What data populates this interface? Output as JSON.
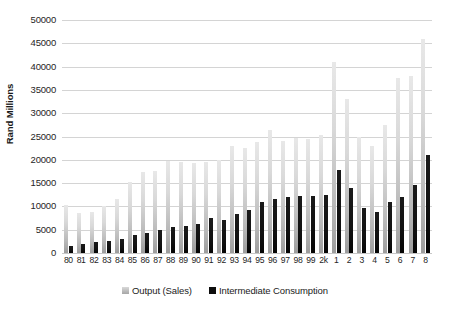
{
  "chart_data": {
    "type": "bar",
    "title": "",
    "xlabel": "",
    "ylabel": "Rand Millions",
    "ylim": [
      0,
      50000
    ],
    "ytick_step": 5000,
    "yticks": [
      "50000",
      "45000",
      "40000",
      "35000",
      "30000",
      "25000",
      "20000",
      "15000",
      "10000",
      "5000",
      "0"
    ],
    "grid": true,
    "legend_position": "bottom",
    "categories": [
      "80",
      "81",
      "82",
      "83",
      "84",
      "85",
      "86",
      "87",
      "88",
      "89",
      "90",
      "91",
      "92",
      "93",
      "94",
      "95",
      "96",
      "97",
      "98",
      "99",
      "2k",
      "1",
      "2",
      "3",
      "4",
      "5",
      "6",
      "7",
      "8"
    ],
    "series": [
      {
        "name": "Output (Sales)",
        "color": "#bfbfbf",
        "values": [
          10200,
          8500,
          8800,
          10100,
          11500,
          15200,
          17300,
          17500,
          19700,
          19500,
          19300,
          19500,
          20000,
          22900,
          22500,
          23800,
          26500,
          24000,
          24700,
          24500,
          25300,
          41000,
          33000,
          25000,
          23000,
          27500,
          37500,
          38000,
          46000
        ]
      },
      {
        "name": "Intermediate Consumption",
        "color": "#0d0d0d",
        "values": [
          1500,
          1900,
          2400,
          2600,
          3100,
          3900,
          4400,
          4900,
          5500,
          5800,
          6200,
          7600,
          7000,
          8400,
          9200,
          11000,
          11600,
          12100,
          12300,
          12300,
          12500,
          17800,
          14000,
          9700,
          8700,
          11000,
          12000,
          14500,
          21000
        ]
      }
    ]
  },
  "legend": {
    "items": [
      {
        "label": "Output (Sales)",
        "swatch": "output"
      },
      {
        "label": "Intermediate Consumption",
        "swatch": "ic"
      }
    ]
  }
}
